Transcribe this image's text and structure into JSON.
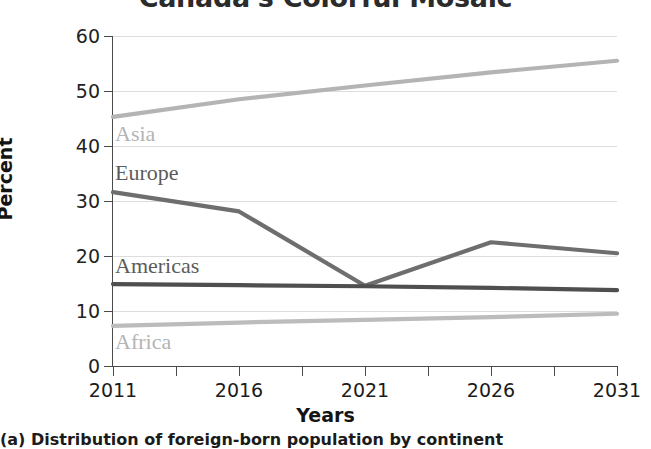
{
  "chart_data": {
    "type": "line",
    "title": "Canada's Colorful Mosaic",
    "caption": "(a) Distribution of foreign-born population by continent",
    "xlabel": "Years",
    "ylabel": "Percent",
    "categories": [
      "2011",
      "2016",
      "2021",
      "2026",
      "2031"
    ],
    "x": [
      2011,
      2016,
      2021,
      2026,
      2031
    ],
    "xlim": [
      2011,
      2031
    ],
    "ylim": [
      0,
      60
    ],
    "ytick_labels": [
      "0",
      "10",
      "20",
      "30",
      "40",
      "50",
      "60"
    ],
    "yticks": [
      0,
      10,
      20,
      30,
      40,
      50,
      60
    ],
    "xtick_labels": [
      "2011",
      "2016",
      "2021",
      "2026",
      "2031"
    ],
    "xticks_minor": [
      2013.5,
      2018.5,
      2023.5,
      2028.5
    ],
    "grid": true,
    "legend_position": "inline-labels",
    "series": [
      {
        "name": "Asia",
        "values": [
          45.3,
          48.5,
          51.0,
          53.4,
          55.5
        ],
        "color": "#b4b4b4",
        "label_style": "light"
      },
      {
        "name": "Europe",
        "values": [
          31.6,
          28.1,
          14.6,
          22.5,
          20.5
        ],
        "color": "#6e6e6e",
        "label_style": "dark"
      },
      {
        "name": "Americas",
        "values": [
          14.9,
          14.7,
          14.5,
          14.2,
          13.8
        ],
        "color": "#4f4f4f",
        "label_style": "dark"
      },
      {
        "name": "Africa",
        "values": [
          7.3,
          7.9,
          8.4,
          8.9,
          9.5
        ],
        "color": "#bcbcbc",
        "label_style": "light"
      }
    ]
  },
  "series_labels": {
    "asia": "Asia",
    "europe": "Europe",
    "americas": "Americas",
    "africa": "Africa"
  }
}
